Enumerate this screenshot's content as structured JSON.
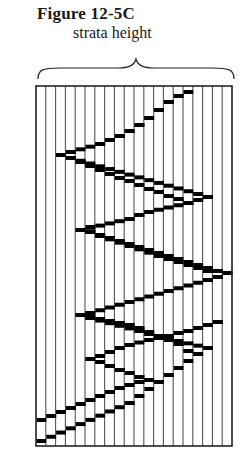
{
  "figure": {
    "title": "Figure 12-5C",
    "label": "strata height"
  },
  "grid": {
    "left": 36,
    "right": 232,
    "top": 86,
    "bottom": 446,
    "columns": 20,
    "line_color": "#555555",
    "block_color": "#000000"
  },
  "path": [
    [
      0,
      441
    ],
    [
      9,
      403
    ],
    [
      16,
      354
    ],
    [
      15,
      351
    ],
    [
      14,
      344
    ],
    [
      13,
      340
    ],
    [
      12,
      336
    ],
    [
      11,
      332
    ],
    [
      10,
      328
    ],
    [
      9,
      325
    ],
    [
      8,
      323
    ],
    [
      4,
      315
    ],
    [
      5,
      313
    ],
    [
      17,
      280
    ],
    [
      18,
      277
    ],
    [
      19,
      273
    ],
    [
      18,
      271
    ],
    [
      5,
      232
    ],
    [
      4,
      230
    ],
    [
      9,
      219
    ],
    [
      10,
      215
    ],
    [
      11,
      212
    ],
    [
      15,
      203
    ],
    [
      16,
      200
    ],
    [
      17,
      197
    ],
    [
      16,
      194
    ],
    [
      3,
      158
    ],
    [
      2,
      155
    ],
    [
      3,
      152
    ],
    [
      6,
      144
    ],
    [
      7,
      140
    ],
    [
      8,
      136
    ],
    [
      9,
      131
    ],
    [
      10,
      125
    ],
    [
      11,
      118
    ],
    [
      12,
      110
    ],
    [
      13,
      102
    ],
    [
      14,
      96
    ],
    [
      15,
      92
    ]
  ],
  "branches": [
    [
      [
        4,
        315
      ],
      [
        5,
        318
      ],
      [
        10,
        331
      ],
      [
        11,
        334
      ],
      [
        17,
        348
      ]
    ],
    [
      [
        5,
        232
      ],
      [
        6,
        236
      ],
      [
        12,
        256
      ],
      [
        13,
        259
      ],
      [
        17,
        271
      ]
    ],
    [
      [
        4,
        230
      ],
      [
        5,
        227
      ]
    ],
    [
      [
        3,
        158
      ],
      [
        4,
        162
      ],
      [
        5,
        166
      ],
      [
        6,
        170
      ],
      [
        7,
        174
      ],
      [
        8,
        178
      ],
      [
        9,
        181
      ],
      [
        10,
        185
      ],
      [
        11,
        189
      ],
      [
        12,
        192
      ],
      [
        13,
        196
      ],
      [
        14,
        199
      ],
      [
        15,
        203
      ]
    ],
    [
      [
        5,
        359
      ],
      [
        6,
        356
      ],
      [
        7,
        352
      ],
      [
        8,
        348
      ],
      [
        9,
        345
      ],
      [
        11,
        340
      ],
      [
        12,
        338
      ],
      [
        13,
        336
      ],
      [
        14,
        333
      ],
      [
        15,
        331
      ],
      [
        16,
        328
      ],
      [
        17,
        325
      ],
      [
        18,
        322
      ]
    ],
    [
      [
        5,
        359
      ],
      [
        6,
        362
      ],
      [
        7,
        366
      ],
      [
        8,
        370
      ],
      [
        9,
        373
      ],
      [
        10,
        377
      ],
      [
        11,
        380
      ]
    ],
    [
      [
        11,
        380
      ],
      [
        10,
        382
      ],
      [
        9,
        385
      ],
      [
        8,
        388
      ],
      [
        7,
        392
      ],
      [
        6,
        396
      ],
      [
        5,
        400
      ],
      [
        4,
        404
      ],
      [
        3,
        408
      ],
      [
        2,
        412
      ],
      [
        1,
        416
      ],
      [
        0,
        420
      ]
    ],
    [
      [
        18,
        322
      ],
      [
        17,
        325
      ]
    ],
    [
      [
        17,
        271
      ],
      [
        18,
        277
      ]
    ]
  ]
}
